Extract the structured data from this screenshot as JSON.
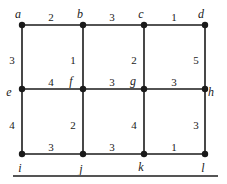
{
  "graph": {
    "nodes": [
      {
        "id": "a",
        "x": 22,
        "y": 25,
        "lx": 18,
        "ly": 15
      },
      {
        "id": "b",
        "x": 83,
        "y": 25,
        "lx": 80,
        "ly": 15
      },
      {
        "id": "c",
        "x": 144,
        "y": 25,
        "lx": 141,
        "ly": 15
      },
      {
        "id": "d",
        "x": 205,
        "y": 25,
        "lx": 201,
        "ly": 15
      },
      {
        "id": "e",
        "x": 22,
        "y": 89,
        "lx": 9,
        "ly": 93
      },
      {
        "id": "f",
        "x": 83,
        "y": 89,
        "lx": 71,
        "ly": 82
      },
      {
        "id": "g",
        "x": 144,
        "y": 89,
        "lx": 133,
        "ly": 82
      },
      {
        "id": "h",
        "x": 205,
        "y": 89,
        "lx": 211,
        "ly": 93
      },
      {
        "id": "i",
        "x": 22,
        "y": 154,
        "lx": 20,
        "ly": 169
      },
      {
        "id": "j",
        "x": 83,
        "y": 154,
        "lx": 81,
        "ly": 170
      },
      {
        "id": "k",
        "x": 144,
        "y": 154,
        "lx": 141,
        "ly": 168
      },
      {
        "id": "l",
        "x": 205,
        "y": 154,
        "lx": 203,
        "ly": 169
      }
    ],
    "edges": [
      {
        "from": "a",
        "to": "b",
        "weight": "2",
        "lx": 51,
        "ly": 18
      },
      {
        "from": "b",
        "to": "c",
        "weight": "3",
        "lx": 112,
        "ly": 18
      },
      {
        "from": "c",
        "to": "d",
        "weight": "1",
        "lx": 174,
        "ly": 18
      },
      {
        "from": "a",
        "to": "e",
        "weight": "3",
        "lx": 12,
        "ly": 61
      },
      {
        "from": "b",
        "to": "f",
        "weight": "1",
        "lx": 73,
        "ly": 61
      },
      {
        "from": "c",
        "to": "g",
        "weight": "2",
        "lx": 134,
        "ly": 61
      },
      {
        "from": "d",
        "to": "h",
        "weight": "5",
        "lx": 196,
        "ly": 61
      },
      {
        "from": "e",
        "to": "f",
        "weight": "4",
        "lx": 51,
        "ly": 83
      },
      {
        "from": "f",
        "to": "g",
        "weight": "3",
        "lx": 112,
        "ly": 83
      },
      {
        "from": "g",
        "to": "h",
        "weight": "3",
        "lx": 174,
        "ly": 83
      },
      {
        "from": "e",
        "to": "i",
        "weight": "4",
        "lx": 12,
        "ly": 126
      },
      {
        "from": "f",
        "to": "j",
        "weight": "2",
        "lx": 73,
        "ly": 126
      },
      {
        "from": "g",
        "to": "k",
        "weight": "4",
        "lx": 134,
        "ly": 126
      },
      {
        "from": "h",
        "to": "l",
        "weight": "3",
        "lx": 196,
        "ly": 126
      },
      {
        "from": "i",
        "to": "j",
        "weight": "3",
        "lx": 51,
        "ly": 148
      },
      {
        "from": "j",
        "to": "k",
        "weight": "3",
        "lx": 112,
        "ly": 148
      },
      {
        "from": "k",
        "to": "l",
        "weight": "1",
        "lx": 174,
        "ly": 148
      }
    ]
  },
  "colors": {
    "stroke": "#1a1a1a",
    "bottom_rule": "#555555"
  }
}
